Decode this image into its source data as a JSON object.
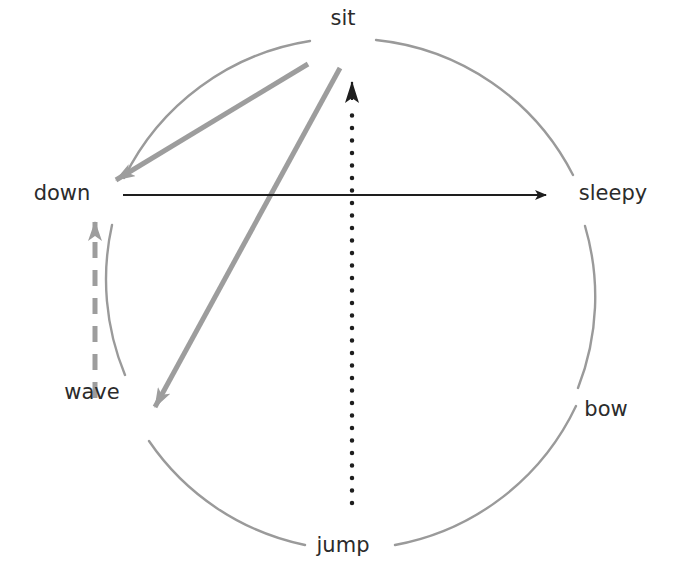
{
  "diagram": {
    "type": "state-transition-circle",
    "nodes": [
      {
        "id": "sit",
        "label": "sit"
      },
      {
        "id": "down",
        "label": "down"
      },
      {
        "id": "sleepy",
        "label": "sleepy"
      },
      {
        "id": "wave",
        "label": "wave"
      },
      {
        "id": "bow",
        "label": "bow"
      },
      {
        "id": "jump",
        "label": "jump"
      }
    ],
    "edges": [
      {
        "from": "sit",
        "to": "down",
        "style": "solid-gray"
      },
      {
        "from": "sit",
        "to": "wave",
        "style": "solid-gray"
      },
      {
        "from": "down",
        "to": "sleepy",
        "style": "solid-black"
      },
      {
        "from": "jump",
        "to": "sit",
        "style": "dotted-black"
      },
      {
        "from": "wave",
        "to": "down",
        "style": "dashed-gray"
      }
    ],
    "colors": {
      "circle": "#9a9a9a",
      "gray_edge": "#9d9d9d",
      "black_edge": "#1e1e1e",
      "label": "#2b2b2b"
    }
  }
}
